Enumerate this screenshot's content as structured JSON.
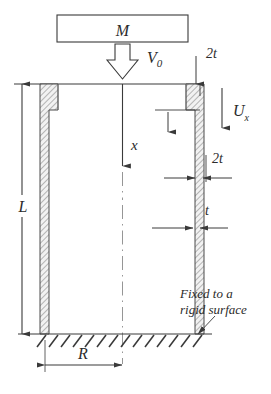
{
  "figure": {
    "type": "engineering-schematic",
    "background": "#ffffff",
    "ink_color": "#3a3a3a",
    "hatch_color": "#9a9a9a"
  },
  "labels": {
    "mass": "M",
    "impact_velocity": "V",
    "impact_velocity_sub": "0",
    "axial_coord": "x",
    "displacement": "U",
    "displacement_sub": "x",
    "length": "L",
    "radius": "R",
    "thickness_thin": "t",
    "thickness_thick_top": "2t",
    "thickness_thick_wall": "2t",
    "support_note_line1": "Fixed to a",
    "support_note_line2": "rigid surface"
  },
  "geometry": {
    "mass_box": {
      "x": 57,
      "y": 15,
      "width": 131,
      "height": 27
    },
    "tube": {
      "top_y": 84,
      "bottom_y": 334,
      "center_x": 122,
      "left_outer_x": 40,
      "left_inner_x": 50,
      "right_inner_x": 194,
      "right_outer_x": 204,
      "flange_bottom_y": 110,
      "flange_thick": 18,
      "wall_thin": 9
    },
    "ground": {
      "y": 334,
      "x_start": 33,
      "x_end": 212,
      "hatch_count": 15
    },
    "dimension_L": {
      "x": 22,
      "y_top": 84,
      "y_bottom": 334
    },
    "dimension_R": {
      "y": 365,
      "x_left": 45,
      "x_right": 122
    }
  },
  "annotations": [
    {
      "name": "mass-label",
      "text": "M"
    },
    {
      "name": "impact-velocity-label",
      "text": "V0"
    },
    {
      "name": "axial-coordinate-label",
      "text": "x"
    },
    {
      "name": "displacement-label",
      "text": "Ux"
    },
    {
      "name": "length-label",
      "text": "L"
    },
    {
      "name": "radius-label",
      "text": "R"
    },
    {
      "name": "top-thickness-label",
      "text": "2t"
    },
    {
      "name": "wall-thickness-thick-label",
      "text": "2t"
    },
    {
      "name": "wall-thickness-thin-label",
      "text": "t"
    },
    {
      "name": "support-note",
      "text": "Fixed to a rigid surface"
    }
  ]
}
